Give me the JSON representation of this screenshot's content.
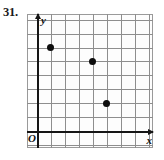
{
  "exercise": {
    "number_label": "31."
  },
  "figure": {
    "origin_label": "O",
    "x_axis_label": "x",
    "y_axis_label": "y",
    "x_axis_arrow": "arrow-right",
    "y_axis_arrow": "arrow-up"
  },
  "chart_data": {
    "type": "scatter",
    "title": "",
    "xlabel": "x",
    "ylabel": "y",
    "grid": true,
    "legend": null,
    "xlim": [
      -0.7,
      8.3
    ],
    "ylim": [
      -1.2,
      8.4
    ],
    "xtick_labels": [],
    "ytick_labels": [],
    "grid_spacing": 1,
    "points": [
      {
        "x": 1,
        "y": 6
      },
      {
        "x": 4,
        "y": 5
      },
      {
        "x": 5,
        "y": 2
      }
    ],
    "annotations": [
      {
        "text": "O",
        "x": 0,
        "y": 0,
        "role": "origin-marker"
      }
    ]
  }
}
